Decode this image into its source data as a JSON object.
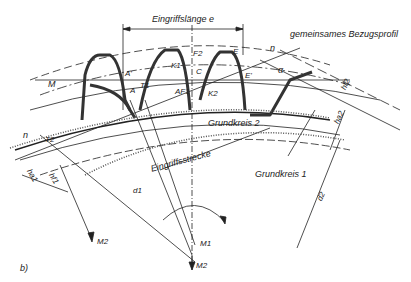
{
  "diagram": {
    "title_top": "Eingriffslänge e",
    "reference_profile": "gemeinsames Bezugsprofil",
    "path_of_contact": "Eingriffsstrecke",
    "base_circle_2": "Grundkreis 2",
    "base_circle_1": "Grundkreis 1",
    "subfigure": "b)",
    "points": {
      "M": "M",
      "A_prime": "A'",
      "A": "A",
      "T1": "T1",
      "K1": "K1",
      "F2": "F2",
      "C": "C",
      "AF1": "AF1",
      "K2": "K2",
      "E": "E",
      "E_prime": "E'",
      "T2": "T2",
      "n_top": "n",
      "n_left": "n",
      "alpha": "α",
      "M1": "M1",
      "M2_bottom": "M2",
      "M2_left": "M2"
    },
    "dimensions": {
      "hf2": "hf2",
      "ha2": "ha2",
      "ha1": "ha1",
      "hf1": "hf1",
      "d1": "d1",
      "d2": "d2"
    }
  }
}
